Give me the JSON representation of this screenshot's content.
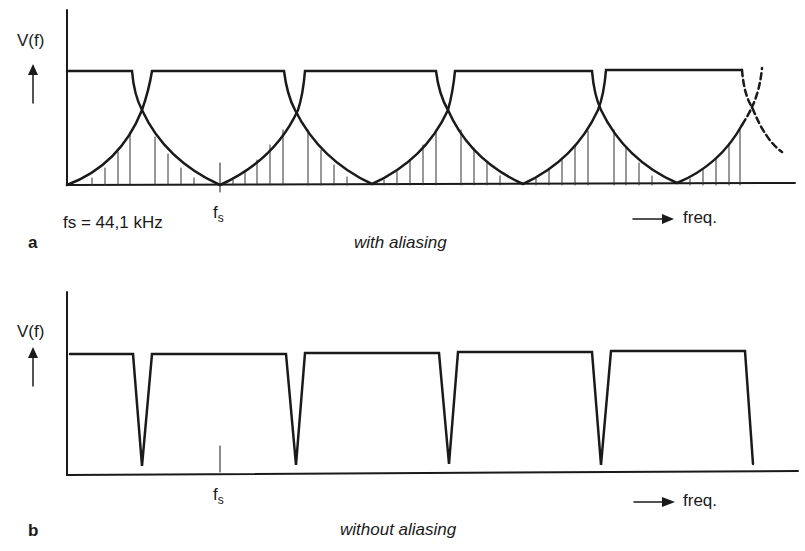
{
  "panel_a": {
    "letter": "a",
    "y_label": "V(f)",
    "x_label": "freq.",
    "tick_label": "f",
    "tick_sub": "s",
    "annotation": "fs = 44,1 kHz",
    "caption": "with aliasing"
  },
  "panel_b": {
    "letter": "b",
    "y_label": "V(f)",
    "x_label": "freq.",
    "tick_label": "f",
    "tick_sub": "s",
    "caption": "without aliasing"
  },
  "colors": {
    "stroke": "#1a1a1a",
    "background": "#ffffff"
  }
}
